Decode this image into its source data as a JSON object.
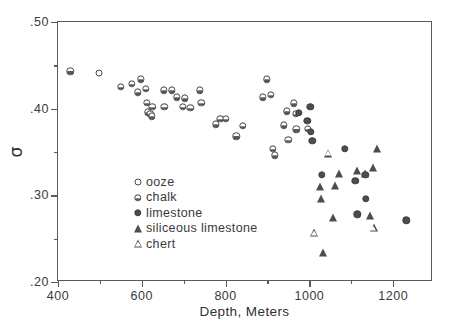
{
  "chart_data": {
    "type": "scatter",
    "title": "",
    "xlabel": "Depth, Meters",
    "ylabel": "σ",
    "xlim": [
      400,
      1295
    ],
    "ylim": [
      0.2,
      0.5
    ],
    "grid": false,
    "legend_position": "inner-left",
    "x_ticks_major": [
      400,
      600,
      800,
      1000,
      1200
    ],
    "x_ticks_major_labels": [
      "400",
      "600",
      "800",
      "1000",
      "1200"
    ],
    "x_ticks_minor": [
      500,
      700,
      900,
      1100
    ],
    "y_ticks_major": [
      0.2,
      0.3,
      0.4,
      0.5
    ],
    "y_ticks_major_labels": [
      ".20",
      ".30",
      ".40",
      ".50"
    ],
    "y_ticks_minor": [
      0.25,
      0.35,
      0.45
    ],
    "series": [
      {
        "name": "ooze",
        "marker": "open-circle",
        "color": "#4a4a4a",
        "points": [
          [
            498,
            0.441
          ]
        ]
      },
      {
        "name": "chalk",
        "marker": "half-filled-circle",
        "color": "#585858",
        "points": [
          [
            429,
            0.443
          ],
          [
            550,
            0.425
          ],
          [
            576,
            0.429
          ],
          [
            590,
            0.419
          ],
          [
            597,
            0.434
          ],
          [
            609,
            0.423
          ],
          [
            612,
            0.407
          ],
          [
            614,
            0.396
          ],
          [
            620,
            0.394
          ],
          [
            624,
            0.391
          ],
          [
            625,
            0.402
          ],
          [
            652,
            0.421
          ],
          [
            654,
            0.402
          ],
          [
            671,
            0.421
          ],
          [
            684,
            0.413
          ],
          [
            698,
            0.402
          ],
          [
            702,
            0.412
          ],
          [
            716,
            0.401
          ],
          [
            739,
            0.421
          ],
          [
            742,
            0.407
          ],
          [
            776,
            0.382
          ],
          [
            787,
            0.388
          ],
          [
            800,
            0.388
          ],
          [
            826,
            0.368
          ],
          [
            841,
            0.38
          ],
          [
            889,
            0.413
          ],
          [
            899,
            0.434
          ],
          [
            908,
            0.416
          ],
          [
            913,
            0.354
          ],
          [
            917,
            0.346
          ],
          [
            939,
            0.381
          ],
          [
            946,
            0.397
          ],
          [
            950,
            0.364
          ],
          [
            963,
            0.406
          ],
          [
            967,
            0.394
          ],
          [
            969,
            0.376
          ],
          [
            996,
            0.377
          ]
        ]
      },
      {
        "name": "limestone",
        "marker": "filled-circle",
        "color": "#4d4d4d",
        "points": [
          [
            975,
            0.395
          ],
          [
            995,
            0.386
          ],
          [
            1002,
            0.402
          ],
          [
            1004,
            0.373
          ],
          [
            1007,
            0.363
          ],
          [
            1030,
            0.324
          ],
          [
            1084,
            0.354
          ],
          [
            1110,
            0.317
          ],
          [
            1114,
            0.278
          ],
          [
            1133,
            0.324
          ],
          [
            1134,
            0.296
          ],
          [
            1231,
            0.271
          ]
        ]
      },
      {
        "name": "siliceous limestone",
        "marker": "filled-triangle",
        "color": "#4d4d4d",
        "points": [
          [
            1025,
            0.31
          ],
          [
            1027,
            0.296
          ],
          [
            1032,
            0.234
          ],
          [
            1056,
            0.274
          ],
          [
            1062,
            0.311
          ],
          [
            1070,
            0.325
          ],
          [
            1114,
            0.328
          ],
          [
            1133,
            0.325
          ],
          [
            1145,
            0.276
          ],
          [
            1152,
            0.332
          ],
          [
            1162,
            0.353
          ]
        ]
      },
      {
        "name": "chert",
        "marker": "open-triangle",
        "color": "#4d4d4d",
        "points": [
          [
            1012,
            0.256
          ],
          [
            1044,
            0.348
          ],
          [
            1153,
            0.262
          ]
        ]
      }
    ]
  },
  "legend": {
    "items": [
      {
        "label": "ooze",
        "marker": "open-circle"
      },
      {
        "label": "chalk",
        "marker": "half-filled-circle"
      },
      {
        "label": "limestone",
        "marker": "filled-circle"
      },
      {
        "label": "siliceous limestone",
        "marker": "filled-triangle"
      },
      {
        "label": "chert",
        "marker": "open-triangle"
      }
    ]
  }
}
